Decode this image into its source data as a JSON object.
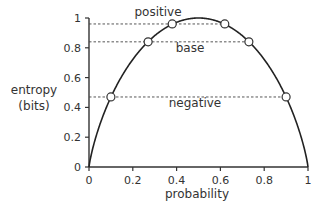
{
  "chart_data": {
    "type": "line",
    "title": "",
    "xlabel": "probability",
    "ylabel": "entropy\n(bits)",
    "ylabel_lines": [
      "entropy",
      "(bits)"
    ],
    "xlim": [
      0,
      1
    ],
    "ylim": [
      0,
      1
    ],
    "xticks": [
      "0",
      "0.2",
      "0.4",
      "0.6",
      "0.8",
      "1"
    ],
    "yticks": [
      "0",
      "0.2",
      "0.4",
      "0.6",
      "0.8",
      "1"
    ],
    "grid": false,
    "series": [
      {
        "name": "binary entropy",
        "function": "H(p) = -p log2 p - (1-p) log2 (1-p)"
      }
    ],
    "reference_lines": [
      {
        "label": "positive",
        "y": 0.96,
        "points_x": [
          0.38,
          0.62
        ]
      },
      {
        "label": "base",
        "y": 0.84,
        "points_x": [
          0.27,
          0.73
        ]
      },
      {
        "label": "negative",
        "y": 0.47,
        "points_x": [
          0.1,
          0.9
        ]
      }
    ]
  },
  "labels": {
    "xlabel": "probability",
    "ylabel_1": "entropy",
    "ylabel_2": "(bits)",
    "positive": "positive",
    "base": "base",
    "negative": "negative"
  }
}
